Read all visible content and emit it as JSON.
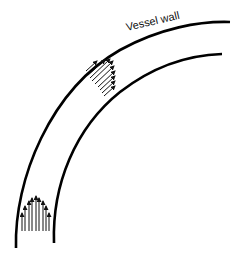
{
  "diagram": {
    "label": "Vessel wall",
    "colors": {
      "background": "#ffffff",
      "stroke": "#000000"
    },
    "walls": [
      {
        "name": "outer-wall",
        "path": "M16,248 C14,180 50,90 120,50 C160,28 200,21 230,22"
      },
      {
        "name": "inner-wall",
        "path": "M54,243 C52,185 75,128 120,92 C155,65 190,55 222,54"
      }
    ],
    "velocity_profiles": [
      {
        "name": "straight-section-profile",
        "shape": "parabolic",
        "direction": "up",
        "arrow_count": 9
      },
      {
        "name": "curved-section-profile",
        "shape": "skewed",
        "direction": "up-right",
        "arrow_count": 9
      }
    ]
  }
}
